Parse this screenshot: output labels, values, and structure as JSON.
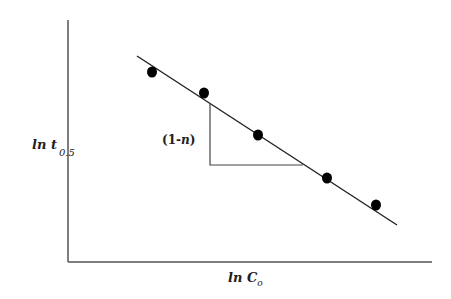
{
  "chart_data": {
    "type": "scatter",
    "title": "",
    "xlabel": "ln C_o",
    "ylabel": "ln t_0.5",
    "xlabel_parts": {
      "main": "ln C",
      "sub": "o"
    },
    "ylabel_parts": {
      "main": "ln t",
      "sub": "0.5"
    },
    "annotation": {
      "prefix": "(1-",
      "var": "n",
      "suffix": ")"
    },
    "axis_ticks": "none",
    "grid": false,
    "legend": "none",
    "series": [
      {
        "name": "data points",
        "points_px": [
          [
            152,
            72
          ],
          [
            204,
            93
          ],
          [
            258,
            135
          ],
          [
            327,
            178
          ],
          [
            376,
            205
          ]
        ]
      }
    ],
    "fit_line_px": {
      "x1": 137,
      "y1": 56,
      "x2": 397,
      "y2": 225
    },
    "slope_triangle_px": {
      "x_left": 210,
      "y_top": 103,
      "y_bottom": 165,
      "x_right": 303
    },
    "axes_px": {
      "origin": [
        68,
        262
      ],
      "y_top": 20,
      "x_right": 432
    },
    "colors": {
      "axis": "#555555",
      "line": "#222222",
      "marker": "#000000"
    }
  }
}
